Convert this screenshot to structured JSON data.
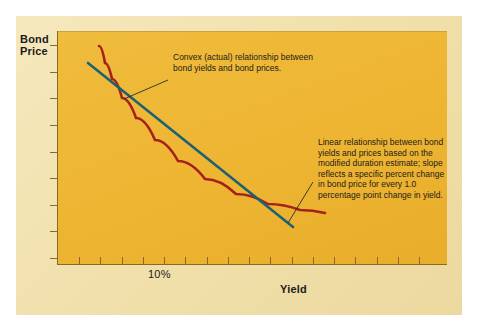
{
  "figure": {
    "y_axis_title": "Bond\nPrice",
    "y_axis_title_line1": "Bond",
    "y_axis_title_line2": "Price",
    "x_axis_title": "Yield",
    "x_tick_label": "10%"
  },
  "annotations": {
    "convex": "Convex (actual) relationship between bond yields and bond prices.",
    "linear": "Linear relationship between bond yields and prices based on the modified duration estimate; slope reflects a specific percent change in bond price for every 1.0 percentage point change in yield."
  },
  "colors": {
    "convex_curve": "#a52119",
    "linear_line": "#1c6274",
    "plot_background": "#eeb835",
    "panel_background": "#f2e2b0",
    "axis": "#8a6a20",
    "text": "#1b1b1b"
  },
  "chart_data": {
    "type": "line",
    "title": "",
    "xlabel": "Yield",
    "ylabel": "Bond Price",
    "grid": false,
    "legend": "none",
    "xticklabels": [
      "10%"
    ],
    "yticklabels": [],
    "x_tick_count": 17,
    "y_tick_count": 9,
    "series": [
      {
        "name": "Convex (actual) relationship",
        "color": "#a52119",
        "type": "curve",
        "points": [
          {
            "x": 99,
            "y": 46
          },
          {
            "x": 105,
            "y": 63
          },
          {
            "x": 112,
            "y": 79
          },
          {
            "x": 122,
            "y": 98
          },
          {
            "x": 136,
            "y": 118
          },
          {
            "x": 155,
            "y": 140
          },
          {
            "x": 178,
            "y": 161
          },
          {
            "x": 205,
            "y": 179
          },
          {
            "x": 236,
            "y": 194
          },
          {
            "x": 268,
            "y": 204
          },
          {
            "x": 300,
            "y": 210
          },
          {
            "x": 325,
            "y": 213
          }
        ]
      },
      {
        "name": "Linear (modified duration) relationship",
        "color": "#1c6274",
        "type": "straight",
        "points": [
          {
            "x": 88,
            "y": 63
          },
          {
            "x": 293,
            "y": 227
          }
        ]
      }
    ],
    "leader_lines": [
      {
        "name": "convex-leader",
        "from": {
          "x": 168,
          "y": 80
        },
        "to": {
          "x": 124,
          "y": 99
        }
      },
      {
        "name": "linear-leader",
        "from": {
          "x": 313,
          "y": 182
        },
        "to": {
          "x": 288,
          "y": 223
        }
      }
    ]
  }
}
